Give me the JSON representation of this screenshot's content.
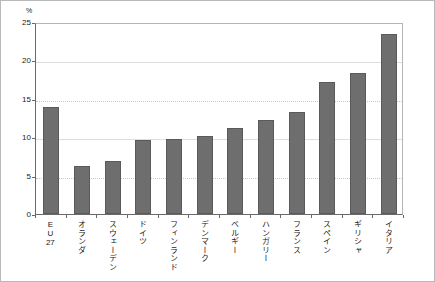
{
  "chart_data": {
    "type": "bar",
    "title": "",
    "xlabel": "",
    "ylabel": "%",
    "ylim": [
      0,
      25
    ],
    "yticks": [
      0,
      5,
      10,
      15,
      20,
      25
    ],
    "ytick_labels": [
      "0",
      "5",
      "10",
      "15",
      "20",
      "25"
    ],
    "grid": true,
    "legend": "none",
    "unit_label": "%",
    "categories": [
      "EU27",
      "オランダ",
      "スウェーデン",
      "ドイツ",
      "フィンランド",
      "デンマーク",
      "ベルギー",
      "ハンガリー",
      "フランス",
      "スペイン",
      "ギリシャ",
      "イタリア"
    ],
    "values": [
      13.9,
      6.3,
      6.9,
      9.6,
      9.8,
      10.1,
      11.2,
      12.2,
      13.3,
      17.2,
      18.4,
      23.4
    ],
    "series": [
      {
        "name": "",
        "values": [
          13.9,
          6.3,
          6.9,
          9.6,
          9.8,
          10.1,
          11.2,
          12.2,
          13.3,
          17.2,
          18.4,
          23.4
        ]
      }
    ],
    "colors": {
      "bar_fill": "#6e6e6e",
      "bar_edge": "#5a5a5a",
      "axis": "#6a6a6a",
      "grid": "#c8c8c8",
      "frame": "#b9b9b9",
      "background": "#ffffff",
      "text": "#1a1a1a"
    }
  }
}
